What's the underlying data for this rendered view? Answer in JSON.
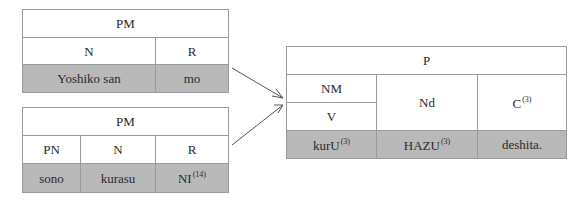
{
  "tables": {
    "top_left": {
      "header": "PM",
      "columns": [
        "N",
        "R"
      ],
      "values": [
        "Yoshiko san",
        "mo"
      ]
    },
    "bottom_left": {
      "header": "PM",
      "columns": [
        "PN",
        "N",
        "R"
      ],
      "values": [
        "sono",
        "kurasu",
        "NI"
      ],
      "superscripts": {
        "NI": "(14)"
      }
    },
    "right": {
      "header": "P",
      "columns": {
        "col1_top": "NM",
        "col1_bottom": "V",
        "col2": "Nd",
        "col3": "C",
        "col3_sup": "(3)"
      },
      "values": [
        "kurU",
        "HAZU",
        "deshita."
      ],
      "value_sups": [
        "(3)",
        "(3)",
        ""
      ]
    }
  },
  "colors": {
    "shade": "#b9b9b9",
    "border": "#9a9a9a",
    "arrow": "#555555"
  }
}
